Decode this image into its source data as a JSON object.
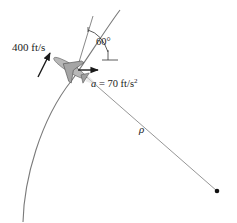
{
  "diagram": {
    "velocity_label": "400 ft/s",
    "acceleration_label_var": "a",
    "acceleration_label_value": " = 70 ft/s",
    "acceleration_label_exp": "2",
    "angle_label": "60°",
    "radius_label": "ρ",
    "colors": {
      "line": "#7a7a7a",
      "arrow": "#1a1a1a",
      "jet": "#9a9a9a",
      "center_dot": "#111111"
    }
  }
}
